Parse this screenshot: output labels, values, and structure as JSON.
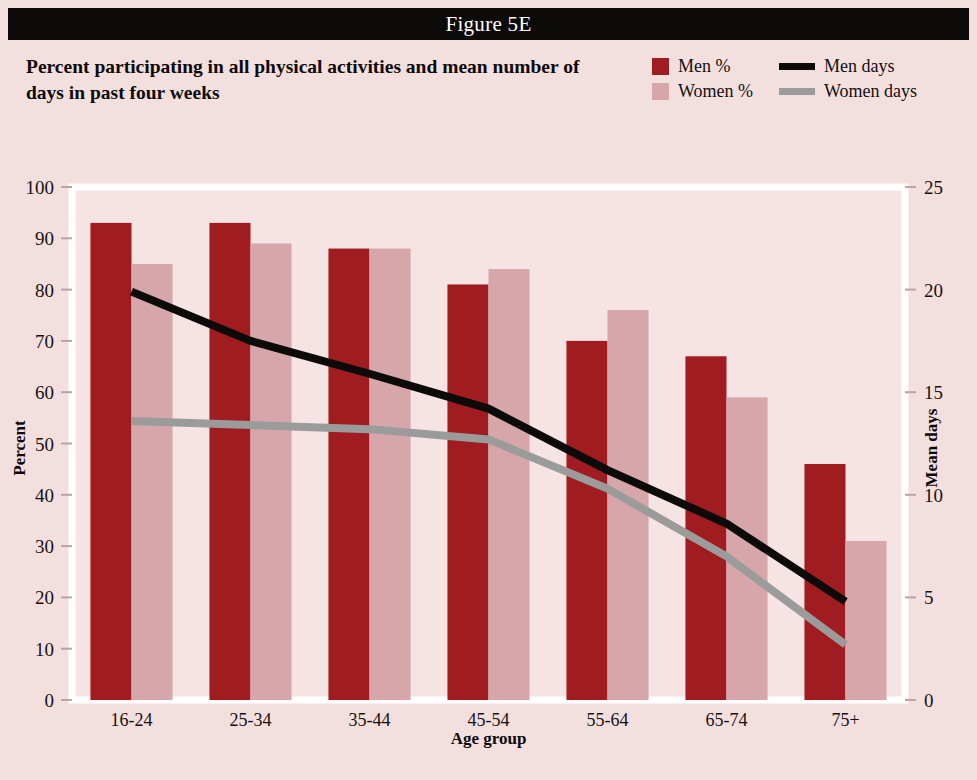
{
  "banner": {
    "label": "Figure 5E"
  },
  "title": {
    "text": "Percent participating in all physical activities and mean number of days in past four weeks"
  },
  "legend": {
    "items": [
      {
        "label": "Men %",
        "type": "swatch",
        "color": "#a01c20"
      },
      {
        "label": "Men days",
        "type": "line",
        "color": "#0d0a0a"
      },
      {
        "label": "Women %",
        "type": "swatch",
        "color": "#d6a6ab"
      },
      {
        "label": "Women days",
        "type": "line",
        "color": "#9b9b9b"
      }
    ]
  },
  "chart_data": {
    "type": "bar",
    "title": "Percent participating in all physical activities and mean number of days in past four weeks",
    "figure_label": "Figure 5E",
    "categories": [
      "16-24",
      "25-34",
      "35-44",
      "45-54",
      "55-64",
      "65-74",
      "75+"
    ],
    "xlabel": "Age group",
    "ylabel": "Percent",
    "ylabel_secondary": "Mean days",
    "ylim": [
      0,
      100
    ],
    "yticks": [
      0,
      10,
      20,
      30,
      40,
      50,
      60,
      70,
      80,
      90,
      100
    ],
    "ylim_secondary": [
      0,
      25
    ],
    "yticks_secondary": [
      0,
      5,
      10,
      15,
      20,
      25
    ],
    "grid": false,
    "legend_position": "top-right",
    "series": [
      {
        "name": "Men %",
        "kind": "bar",
        "axis": "left",
        "color": "#a01c20",
        "values": [
          93,
          93,
          88,
          81,
          70,
          67,
          46
        ]
      },
      {
        "name": "Women %",
        "kind": "bar",
        "axis": "left",
        "color": "#d6a6ab",
        "values": [
          85,
          89,
          88,
          84,
          76,
          59,
          31
        ]
      },
      {
        "name": "Men days",
        "kind": "line",
        "axis": "right",
        "color": "#0d0a0a",
        "values": [
          19.9,
          17.5,
          15.9,
          14.2,
          11.2,
          8.6,
          4.8
        ]
      },
      {
        "name": "Women days",
        "kind": "line",
        "axis": "right",
        "color": "#9b9b9b",
        "values": [
          13.6,
          13.4,
          13.2,
          12.7,
          10.3,
          7.0,
          2.7
        ]
      }
    ]
  }
}
